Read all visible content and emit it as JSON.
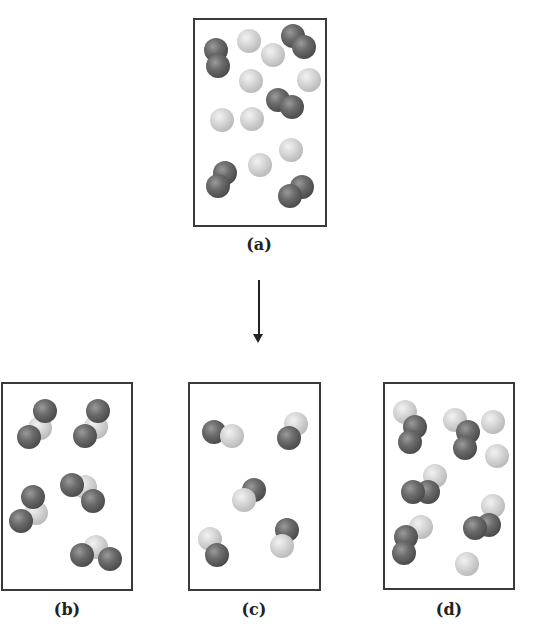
{
  "figure": {
    "panels": [
      {
        "id": "a",
        "label": "(a)",
        "description": "Reactant mixture: 4 diatomic dark molecules and 8 light single atoms",
        "box": {
          "left": 193,
          "top": 18,
          "width": 134,
          "height": 209
        },
        "label_pos": {
          "x": 259,
          "y": 245
        },
        "atoms": [
          {
            "x": 216,
            "y": 50,
            "c": "dark"
          },
          {
            "x": 218,
            "y": 66,
            "c": "dark"
          },
          {
            "x": 249,
            "y": 41,
            "c": "light"
          },
          {
            "x": 273,
            "y": 55,
            "c": "light"
          },
          {
            "x": 293,
            "y": 36,
            "c": "dark"
          },
          {
            "x": 304,
            "y": 47,
            "c": "dark"
          },
          {
            "x": 251,
            "y": 81,
            "c": "light"
          },
          {
            "x": 309,
            "y": 80,
            "c": "light"
          },
          {
            "x": 278,
            "y": 100,
            "c": "dark"
          },
          {
            "x": 292,
            "y": 107,
            "c": "dark"
          },
          {
            "x": 222,
            "y": 120,
            "c": "light"
          },
          {
            "x": 252,
            "y": 119,
            "c": "light"
          },
          {
            "x": 291,
            "y": 150,
            "c": "light"
          },
          {
            "x": 260,
            "y": 165,
            "c": "light"
          },
          {
            "x": 225,
            "y": 173,
            "c": "dark"
          },
          {
            "x": 218,
            "y": 186,
            "c": "dark"
          },
          {
            "x": 302,
            "y": 187,
            "c": "dark"
          },
          {
            "x": 290,
            "y": 196,
            "c": "dark"
          }
        ]
      },
      {
        "id": "b",
        "label": "(b)",
        "description": "Five triatomic molecules: dark-light-dark",
        "box": {
          "left": 1,
          "top": 382,
          "width": 132,
          "height": 209
        },
        "label_pos": {
          "x": 67,
          "y": 610
        },
        "atoms": [
          {
            "x": 40,
            "y": 428,
            "c": "light"
          },
          {
            "x": 45,
            "y": 411,
            "c": "dark"
          },
          {
            "x": 29,
            "y": 437,
            "c": "dark"
          },
          {
            "x": 96,
            "y": 427,
            "c": "light"
          },
          {
            "x": 98,
            "y": 411,
            "c": "dark"
          },
          {
            "x": 85,
            "y": 436,
            "c": "dark"
          },
          {
            "x": 36,
            "y": 513,
            "c": "light"
          },
          {
            "x": 33,
            "y": 497,
            "c": "dark"
          },
          {
            "x": 21,
            "y": 521,
            "c": "dark"
          },
          {
            "x": 85,
            "y": 487,
            "c": "light"
          },
          {
            "x": 72,
            "y": 485,
            "c": "dark"
          },
          {
            "x": 93,
            "y": 501,
            "c": "dark"
          },
          {
            "x": 96,
            "y": 547,
            "c": "light"
          },
          {
            "x": 82,
            "y": 555,
            "c": "dark"
          },
          {
            "x": 110,
            "y": 559,
            "c": "dark"
          }
        ]
      },
      {
        "id": "c",
        "label": "(c)",
        "description": "Five diatomic molecules: dark-light",
        "box": {
          "left": 188,
          "top": 382,
          "width": 133,
          "height": 209
        },
        "label_pos": {
          "x": 254,
          "y": 610
        },
        "atoms": [
          {
            "x": 214,
            "y": 432,
            "c": "dark"
          },
          {
            "x": 232,
            "y": 436,
            "c": "light"
          },
          {
            "x": 296,
            "y": 424,
            "c": "light"
          },
          {
            "x": 289,
            "y": 438,
            "c": "dark"
          },
          {
            "x": 254,
            "y": 490,
            "c": "dark"
          },
          {
            "x": 244,
            "y": 500,
            "c": "light"
          },
          {
            "x": 210,
            "y": 539,
            "c": "light"
          },
          {
            "x": 217,
            "y": 555,
            "c": "dark"
          },
          {
            "x": 287,
            "y": 530,
            "c": "dark"
          },
          {
            "x": 282,
            "y": 546,
            "c": "light"
          }
        ]
      },
      {
        "id": "d",
        "label": "(d)",
        "description": "Five triatomic molecules (light-dark-dark) plus leftover light atoms",
        "box": {
          "left": 383,
          "top": 382,
          "width": 132,
          "height": 208
        },
        "label_pos": {
          "x": 449,
          "y": 610
        },
        "atoms": [
          {
            "x": 405,
            "y": 412,
            "c": "light"
          },
          {
            "x": 415,
            "y": 427,
            "c": "dark"
          },
          {
            "x": 410,
            "y": 442,
            "c": "dark"
          },
          {
            "x": 455,
            "y": 420,
            "c": "light"
          },
          {
            "x": 468,
            "y": 432,
            "c": "dark"
          },
          {
            "x": 465,
            "y": 448,
            "c": "dark"
          },
          {
            "x": 493,
            "y": 422,
            "c": "light"
          },
          {
            "x": 497,
            "y": 456,
            "c": "light"
          },
          {
            "x": 435,
            "y": 476,
            "c": "light"
          },
          {
            "x": 428,
            "y": 492,
            "c": "dark"
          },
          {
            "x": 413,
            "y": 492,
            "c": "dark"
          },
          {
            "x": 493,
            "y": 506,
            "c": "light"
          },
          {
            "x": 489,
            "y": 525,
            "c": "dark"
          },
          {
            "x": 475,
            "y": 528,
            "c": "dark"
          },
          {
            "x": 421,
            "y": 527,
            "c": "light"
          },
          {
            "x": 406,
            "y": 537,
            "c": "dark"
          },
          {
            "x": 404,
            "y": 553,
            "c": "dark"
          },
          {
            "x": 467,
            "y": 564,
            "c": "light"
          }
        ]
      }
    ],
    "arrow": {
      "direction": "down",
      "from": "(a)",
      "to": "row of (b),(c),(d)"
    },
    "colors": {
      "dark_atom": "#5a5a5a",
      "light_atom": "#cfcfcf",
      "border": "#3a3a3a"
    }
  }
}
